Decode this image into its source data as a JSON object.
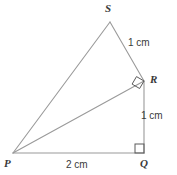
{
  "figure": {
    "type": "geometry-diagram",
    "stroke_color": "#9a9a9a",
    "text_color": "#3a3a3a",
    "background_color": "#ffffff",
    "vertices": [
      {
        "name": "S",
        "label": "S",
        "x": 110,
        "y": 22
      },
      {
        "name": "R",
        "label": "R",
        "x": 144,
        "y": 81
      },
      {
        "name": "Q",
        "label": "Q",
        "x": 144,
        "y": 153
      },
      {
        "name": "P",
        "label": "P",
        "x": 13,
        "y": 153
      }
    ],
    "segments": [
      {
        "name": "PS",
        "from": "P",
        "to": "S"
      },
      {
        "name": "SR",
        "from": "S",
        "to": "R"
      },
      {
        "name": "PR",
        "from": "P",
        "to": "R"
      },
      {
        "name": "RQ",
        "from": "R",
        "to": "Q"
      },
      {
        "name": "PQ",
        "from": "P",
        "to": "Q"
      }
    ],
    "measurements": {
      "SR": "1 cm",
      "RQ": "1 cm",
      "PQ": "2 cm"
    },
    "right_angles": [
      {
        "at": "R",
        "style": "rotated-square"
      },
      {
        "at": "Q",
        "style": "axis-aligned-square"
      }
    ]
  }
}
